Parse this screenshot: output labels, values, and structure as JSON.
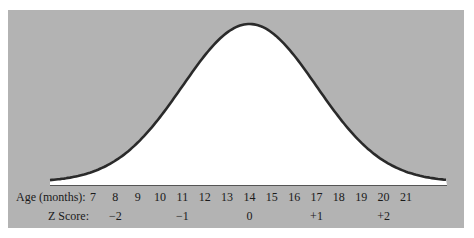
{
  "chart_data": {
    "type": "area",
    "title": "",
    "xlabel": "Age (months)",
    "ylabel": "",
    "x_axis": {
      "label": "Age (months):",
      "ticks": [
        7,
        8,
        9,
        10,
        11,
        12,
        13,
        14,
        15,
        16,
        17,
        18,
        19,
        20,
        21
      ]
    },
    "secondary_axis": {
      "label": "Z Score:",
      "ticks": [
        {
          "age": 8,
          "label": "−2"
        },
        {
          "age": 11,
          "label": "−1"
        },
        {
          "age": 14,
          "label": "0"
        },
        {
          "age": 17,
          "label": "+1"
        },
        {
          "age": 20,
          "label": "+2"
        }
      ]
    },
    "distribution": {
      "mean": 14,
      "sd": 3
    },
    "x_range": [
      6,
      23
    ],
    "grid": false,
    "legend": null,
    "colors": {
      "panel": "#b3b3b3",
      "fill": "#ffffff",
      "curve": "#2a2a2a",
      "text": "#1a1a1a"
    }
  },
  "labels": {
    "age_row": "Age (months):",
    "z_row": "Z Score:"
  }
}
